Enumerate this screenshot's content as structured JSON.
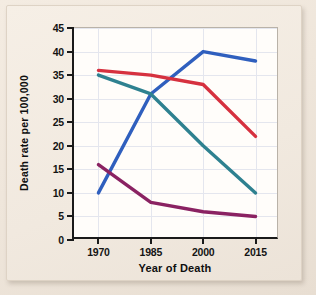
{
  "chart_data": {
    "type": "line",
    "title": "",
    "xlabel": "Year of Death",
    "ylabel": "Death rate per 100,000",
    "x": [
      1970,
      1985,
      2000,
      2015
    ],
    "xtick_labels": [
      "1970",
      "1985",
      "2000",
      "2015"
    ],
    "ytick_labels": [
      "0",
      "5",
      "10",
      "15",
      "20",
      "25",
      "30",
      "35",
      "40",
      "45"
    ],
    "yticks": [
      0,
      5,
      10,
      15,
      20,
      25,
      30,
      35,
      40,
      45
    ],
    "ylim": [
      0,
      45
    ],
    "xlim": [
      1963,
      2022
    ],
    "grid": true,
    "legend": "none",
    "series": [
      {
        "name": "blue-series",
        "color": "#2f5fbe",
        "values": [
          10,
          31,
          40,
          38
        ]
      },
      {
        "name": "red-series",
        "color": "#d6313f",
        "values": [
          36,
          35,
          33,
          22
        ]
      },
      {
        "name": "teal-series",
        "color": "#2e8190",
        "values": [
          35,
          31,
          20,
          10
        ]
      },
      {
        "name": "purple-series",
        "color": "#8a2262",
        "values": [
          16,
          8,
          6,
          5
        ]
      }
    ]
  },
  "axes": {
    "x_title": "Year of Death",
    "y_title": "Death rate per 100,000"
  }
}
